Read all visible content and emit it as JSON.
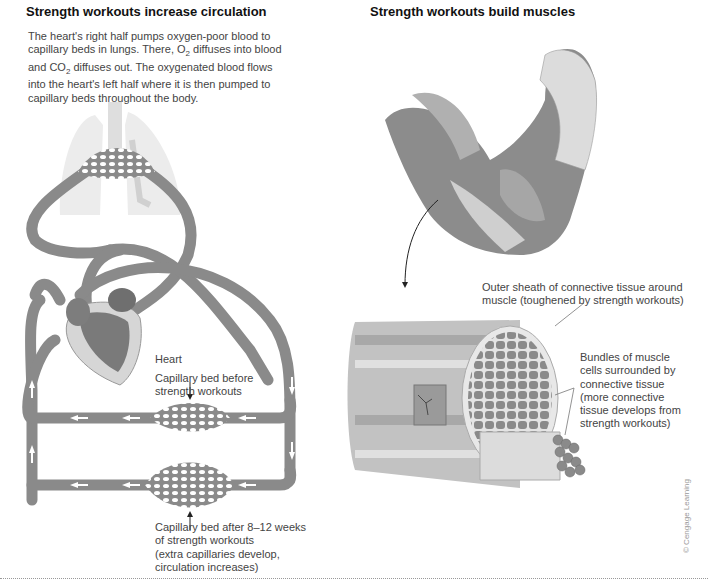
{
  "left_panel": {
    "title": "Strength workouts increase circulation",
    "intro_lines": [
      "The heart's right half pumps oxygen-poor blood to",
      "capillary beds in lungs. There, O",
      "2",
      " diffuses into blood",
      "and CO",
      "2",
      " diffuses out. The oxygenated blood flows",
      "into the heart's left half where it is then pumped to",
      "capillary beds throughout the body."
    ],
    "labels": {
      "heart": "Heart",
      "bed_before_1": "Capillary bed before",
      "bed_before_2": "strength workouts",
      "bed_after_1": "Capillary bed after 8–12 weeks",
      "bed_after_2": "of strength workouts",
      "bed_after_3": "(extra capillaries develop,",
      "bed_after_4": "circulation increases)"
    },
    "icons": [
      "lungs-icon",
      "heart-icon",
      "capillary-bed-icon",
      "flow-arrow-icon"
    ]
  },
  "right_panel": {
    "title": "Strength workouts build muscles",
    "labels": {
      "sheath_1": "Outer sheath of connective tissue around",
      "sheath_2": "muscle (toughened by strength workouts)",
      "bundles_1": "Bundles of muscle",
      "bundles_2": "cells surrounded by",
      "bundles_3": "connective tissue",
      "bundles_4": "(more connective",
      "bundles_5": "tissue develops from",
      "bundles_6": "strength workouts)"
    },
    "icons": [
      "arm-muscle-icon",
      "muscle-cross-section-icon"
    ]
  },
  "credit": "© Cengage Learning",
  "colors": {
    "vessel": "#8a8a8a",
    "vessel_dark": "#6f6f6f",
    "lung": "#e6e6e6",
    "muscle": "#8c8c8c",
    "muscle_light": "#c8c8c8",
    "tissue": "#d9d9d9"
  }
}
